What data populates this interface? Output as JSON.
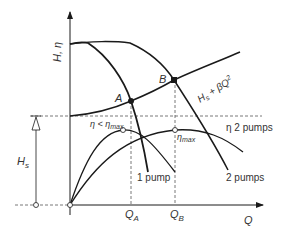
{
  "diagram": {
    "axes": {
      "y_label": "H, η",
      "x_label": "Q"
    },
    "points": {
      "A": "A",
      "B": "B"
    },
    "x_ticks": {
      "QA_main": "Q",
      "QA_sub": "A",
      "QB_main": "Q",
      "QB_sub": "B"
    },
    "static_head": {
      "main": "H",
      "sub": "s"
    },
    "system_curve": {
      "label_main": "H",
      "label_sub": "s",
      "label_rest": " + βQ",
      "label_sup": "2"
    },
    "curves": {
      "one_pump": "1 pump",
      "two_pumps": "2 pumps",
      "eta_two_pumps": "η 2 pumps"
    },
    "efficiency": {
      "eta_less_main": "η < η",
      "eta_less_sub": "max",
      "eta_max_main": "η",
      "eta_max_sub": "max"
    },
    "colors": {
      "line": "#1a1a1a",
      "dashed": "#555555",
      "text": "#333333",
      "background": "#ffffff"
    }
  }
}
